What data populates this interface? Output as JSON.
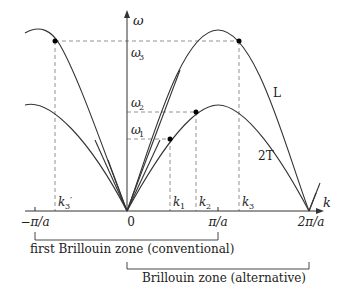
{
  "axes": {
    "y_label": "ω",
    "x_label": "k"
  },
  "frequency_labels": {
    "w1": "ω",
    "w1_sub": "1",
    "w2": "ω",
    "w2_sub": "2",
    "w3": "ω",
    "w3_sub": "3"
  },
  "k_labels": {
    "k1": "k",
    "k1_sub": "1",
    "k2": "k",
    "k2_sub": "2",
    "k3": "k",
    "k3_sub": "3",
    "k3p": "k",
    "k3p_sub": "3",
    "k3p_prime": "′"
  },
  "tick_labels": {
    "neg_pi_a": "−π/a",
    "zero": "0",
    "pi_a": "π/a",
    "two_pi_a": "2π/a"
  },
  "branch_labels": {
    "longitudinal": "L",
    "transverse": "2T"
  },
  "zones": {
    "conventional": "first Brillouin zone (conventional)",
    "alternative": "Brillouin zone (alternative)"
  },
  "colors": {
    "line": "#333333",
    "dashed": "#777777",
    "text": "#222222"
  }
}
